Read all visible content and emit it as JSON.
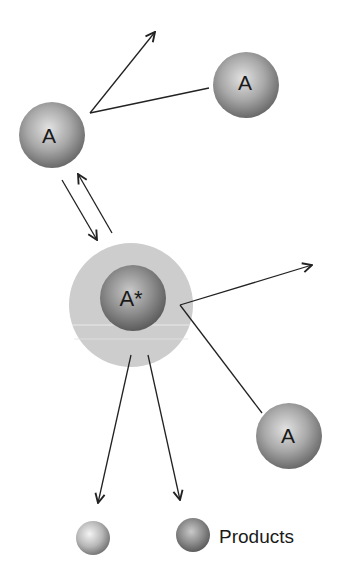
{
  "diagram": {
    "labels": {
      "molecule_top_left": "A",
      "molecule_top_right": "A",
      "activated_molecule": "A*",
      "molecule_bottom_right": "A",
      "products": "Products"
    },
    "colors": {
      "sphere_dark": "#6e6e6e",
      "sphere_light": "#d8d8d8",
      "halo": "#cfcfcf",
      "line": "#222222",
      "background": "#ffffff"
    }
  }
}
